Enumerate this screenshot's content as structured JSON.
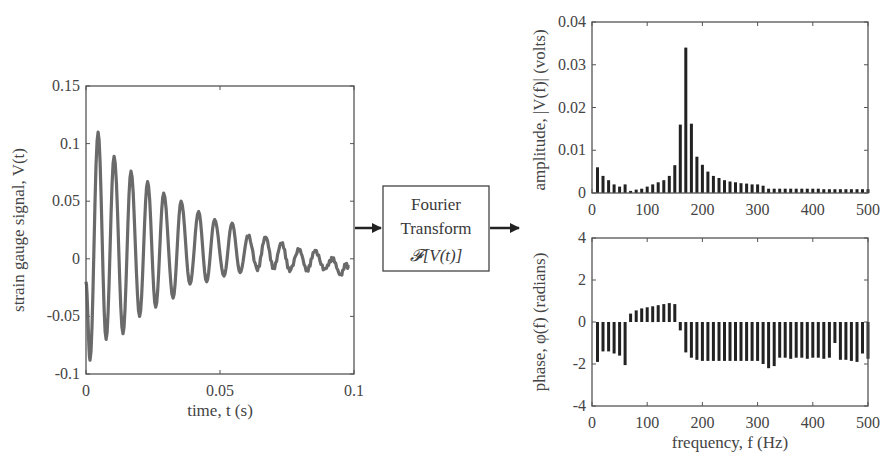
{
  "chart_data": [
    {
      "type": "line",
      "title": "",
      "xlabel": "time, t (s)",
      "ylabel": "strain gauge signal, V(t)",
      "xlim": [
        0,
        0.1
      ],
      "ylim": [
        -0.1,
        0.15
      ],
      "xticks": [
        "0",
        "0.05",
        "0.1"
      ],
      "yticks": [
        "-0.1",
        "-0.05",
        "0",
        "0.05",
        "0.1",
        "0.15"
      ],
      "grid": false,
      "description": "Damped oscillation, ~160 Hz, initial amplitude ~0.1 V decaying to ~0.01 V by 0.1 s",
      "series": [
        {
          "name": "V(t)",
          "color": "#666666",
          "peaks_t": [
            0.0045,
            0.0105,
            0.0168,
            0.023,
            0.029,
            0.0355,
            0.042,
            0.048,
            0.0545,
            0.0605,
            0.067,
            0.073,
            0.0795,
            0.0855,
            0.092,
            0.097
          ],
          "peaks_v": [
            0.11,
            0.089,
            0.076,
            0.067,
            0.057,
            0.05,
            0.041,
            0.034,
            0.031,
            0.02,
            0.019,
            0.014,
            0.008,
            0.007,
            0.0,
            -0.005
          ],
          "troughs_t": [
            0.0015,
            0.0075,
            0.0138,
            0.02,
            0.026,
            0.0325,
            0.0388,
            0.045,
            0.0515,
            0.0575,
            0.064,
            0.07,
            0.076,
            0.0825,
            0.089,
            0.095
          ],
          "troughs_v": [
            -0.088,
            -0.07,
            -0.065,
            -0.05,
            -0.042,
            -0.034,
            -0.022,
            -0.02,
            -0.015,
            -0.012,
            -0.009,
            -0.008,
            -0.01,
            -0.01,
            -0.009,
            -0.014
          ]
        }
      ]
    },
    {
      "type": "bar",
      "title": "",
      "xlabel": "",
      "ylabel": "amplitude, |V(f)| (volts)",
      "xlim": [
        0,
        500
      ],
      "ylim": [
        0,
        0.04
      ],
      "xticks": [
        "0",
        "100",
        "200",
        "300",
        "400",
        "500"
      ],
      "yticks": [
        "0",
        "0.01",
        "0.02",
        "0.03",
        "0.04"
      ],
      "grid": false,
      "x": [
        10,
        20,
        30,
        40,
        50,
        60,
        70,
        80,
        90,
        100,
        110,
        120,
        130,
        140,
        150,
        160,
        170,
        180,
        190,
        200,
        210,
        220,
        230,
        240,
        250,
        260,
        270,
        280,
        290,
        300,
        310,
        320,
        330,
        340,
        350,
        360,
        370,
        380,
        390,
        400,
        410,
        420,
        430,
        440,
        450,
        460,
        470,
        480,
        490,
        500
      ],
      "values": [
        0.006,
        0.004,
        0.003,
        0.002,
        0.0015,
        0.002,
        0.0005,
        0.0008,
        0.001,
        0.0015,
        0.002,
        0.0025,
        0.003,
        0.004,
        0.0065,
        0.016,
        0.034,
        0.0162,
        0.0085,
        0.0066,
        0.005,
        0.004,
        0.0035,
        0.003,
        0.0027,
        0.0025,
        0.0023,
        0.0022,
        0.002,
        0.002,
        0.0017,
        0.001,
        0.001,
        0.001,
        0.001,
        0.001,
        0.001,
        0.001,
        0.001,
        0.001,
        0.001,
        0.0009,
        0.0009,
        0.0009,
        0.0009,
        0.0009,
        0.0009,
        0.0009,
        0.0009,
        0.0009
      ],
      "color": "#222222"
    },
    {
      "type": "bar",
      "title": "",
      "xlabel": "frequency, f (Hz)",
      "ylabel": "phase, φ(f) (radians)",
      "xlim": [
        0,
        500
      ],
      "ylim": [
        -4,
        4
      ],
      "xticks": [
        "0",
        "100",
        "200",
        "300",
        "400",
        "500"
      ],
      "yticks": [
        "-4",
        "-2",
        "0",
        "2",
        "4"
      ],
      "grid": false,
      "x": [
        10,
        20,
        30,
        40,
        50,
        60,
        70,
        80,
        90,
        100,
        110,
        120,
        130,
        140,
        150,
        160,
        170,
        180,
        190,
        200,
        210,
        220,
        230,
        240,
        250,
        260,
        270,
        280,
        290,
        300,
        310,
        320,
        330,
        340,
        350,
        360,
        370,
        380,
        390,
        400,
        410,
        420,
        430,
        440,
        450,
        460,
        470,
        480,
        490,
        500
      ],
      "values": [
        -1.9,
        -1.4,
        -1.4,
        -1.5,
        -1.6,
        -2.05,
        0.4,
        0.55,
        0.65,
        0.7,
        0.75,
        0.8,
        0.85,
        0.9,
        0.85,
        -0.4,
        -1.45,
        -1.7,
        -1.8,
        -1.85,
        -1.85,
        -1.85,
        -1.85,
        -1.85,
        -1.85,
        -1.85,
        -1.85,
        -1.85,
        -1.85,
        -1.85,
        -2.0,
        -2.2,
        -2.1,
        -1.7,
        -1.7,
        -1.75,
        -1.7,
        -1.7,
        -1.75,
        -1.7,
        -1.7,
        -1.75,
        -1.7,
        -1.0,
        -1.8,
        -1.8,
        -1.85,
        -1.9,
        -1.5,
        -1.75
      ],
      "color": "#222222"
    }
  ],
  "transform_box": {
    "line1": "Fourier",
    "line2": "Transform",
    "line3": "𝓕[V(t)]"
  }
}
